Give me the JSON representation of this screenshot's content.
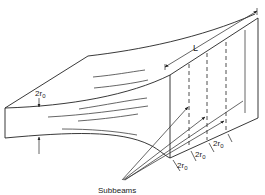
{
  "figure": {
    "type": "beam-splitting-diagram",
    "labels": {
      "height": "2r",
      "height_sub": "0",
      "length": "L",
      "subbeams": "Subbeams",
      "width_1": "2r",
      "width_1_sub": "0",
      "width_2": "2r",
      "width_2_sub": "0",
      "width_3": "2r",
      "width_3_sub": "0"
    },
    "subbeam_count": 4,
    "colors": {
      "line": "#222222",
      "background": "#ffffff"
    }
  }
}
